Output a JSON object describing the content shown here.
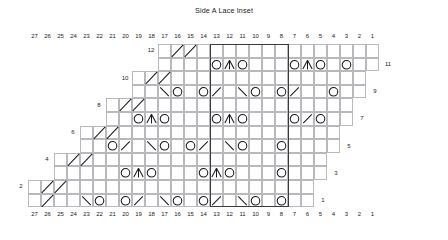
{
  "title": "Side A Lace Inset",
  "colors": {
    "grid_line": "#b9b9bd",
    "heavy_line": "#3a3a3a",
    "symbol": "#1a1a1a",
    "text": "#222222",
    "background": "#ffffff"
  },
  "geometry": {
    "cell_w": 13.0,
    "cell_h": 13.6,
    "grid_left": 28.0,
    "grid_top": 44.0,
    "cols": 27,
    "rows": 12
  },
  "axis": {
    "column_numbers_top": [
      27,
      26,
      25,
      24,
      23,
      22,
      21,
      20,
      19,
      18,
      17,
      16,
      15,
      14,
      13,
      12,
      11,
      10,
      9,
      8,
      7,
      6,
      5,
      4,
      3,
      2,
      1
    ],
    "column_numbers_bottom": [
      27,
      26,
      25,
      24,
      23,
      22,
      21,
      20,
      19,
      18,
      17,
      16,
      15,
      14,
      13,
      12,
      11,
      10,
      9,
      8,
      7,
      6,
      5,
      4,
      3,
      2,
      1
    ],
    "row_numbers_left": [
      12,
      10,
      8,
      6,
      4,
      2
    ],
    "row_numbers_right": [
      11,
      9,
      7,
      5,
      3,
      1
    ]
  },
  "legend_symbols": {
    "yo": "yarn-over",
    "k2tog": "right-leaning-decrease",
    "ssk": "left-leaning-decrease",
    "cdd": "central-double-decrease",
    "edge": "diagonal-edge-line"
  },
  "chart_data": {
    "type": "table",
    "title": "Side A Lace Inset",
    "xlabel": "Stitch",
    "ylabel": "Row",
    "cols": 27,
    "rows": 12,
    "heavy_column_boundaries": [
      8,
      14
    ],
    "note": "Columns numbered right-to-left 27..1. Row extents give first and last worked column number for each row.",
    "row_extents": [
      {
        "row": 1,
        "col_hi": 27,
        "col_lo": 6
      },
      {
        "row": 2,
        "col_hi": 27,
        "col_lo": 6
      },
      {
        "row": 3,
        "col_hi": 25,
        "col_lo": 5
      },
      {
        "row": 4,
        "col_hi": 25,
        "col_lo": 5
      },
      {
        "row": 5,
        "col_hi": 23,
        "col_lo": 4
      },
      {
        "row": 6,
        "col_hi": 23,
        "col_lo": 4
      },
      {
        "row": 7,
        "col_hi": 21,
        "col_lo": 3
      },
      {
        "row": 8,
        "col_hi": 21,
        "col_lo": 3
      },
      {
        "row": 9,
        "col_hi": 19,
        "col_lo": 2
      },
      {
        "row": 10,
        "col_hi": 19,
        "col_lo": 2
      },
      {
        "row": 11,
        "col_hi": 17,
        "col_lo": 1
      },
      {
        "row": 12,
        "col_hi": 17,
        "col_lo": 1
      }
    ],
    "symbols": [
      {
        "row": 1,
        "col": 26,
        "sym": "edge"
      },
      {
        "row": 1,
        "col": 23,
        "sym": "ssk"
      },
      {
        "row": 1,
        "col": 22,
        "sym": "yo"
      },
      {
        "row": 1,
        "col": 20,
        "sym": "yo"
      },
      {
        "row": 1,
        "col": 19,
        "sym": "k2tog"
      },
      {
        "row": 1,
        "col": 17,
        "sym": "ssk"
      },
      {
        "row": 1,
        "col": 16,
        "sym": "yo"
      },
      {
        "row": 1,
        "col": 14,
        "sym": "yo"
      },
      {
        "row": 1,
        "col": 13,
        "sym": "k2tog"
      },
      {
        "row": 1,
        "col": 11,
        "sym": "ssk"
      },
      {
        "row": 1,
        "col": 10,
        "sym": "yo"
      },
      {
        "row": 1,
        "col": 8,
        "sym": "yo"
      },
      {
        "row": 2,
        "col": 25,
        "sym": "edge"
      },
      {
        "row": 2,
        "col": 26,
        "sym": "edge"
      },
      {
        "row": 3,
        "col": 20,
        "sym": "yo"
      },
      {
        "row": 3,
        "col": 19,
        "sym": "cdd"
      },
      {
        "row": 3,
        "col": 18,
        "sym": "yo"
      },
      {
        "row": 3,
        "col": 14,
        "sym": "yo"
      },
      {
        "row": 3,
        "col": 13,
        "sym": "cdd"
      },
      {
        "row": 3,
        "col": 12,
        "sym": "yo"
      },
      {
        "row": 3,
        "col": 8,
        "sym": "yo"
      },
      {
        "row": 4,
        "col": 24,
        "sym": "edge"
      },
      {
        "row": 4,
        "col": 23,
        "sym": "edge"
      },
      {
        "row": 5,
        "col": 21,
        "sym": "yo"
      },
      {
        "row": 5,
        "col": 20,
        "sym": "k2tog"
      },
      {
        "row": 5,
        "col": 18,
        "sym": "ssk"
      },
      {
        "row": 5,
        "col": 17,
        "sym": "yo"
      },
      {
        "row": 5,
        "col": 15,
        "sym": "yo"
      },
      {
        "row": 5,
        "col": 14,
        "sym": "k2tog"
      },
      {
        "row": 5,
        "col": 12,
        "sym": "ssk"
      },
      {
        "row": 5,
        "col": 11,
        "sym": "yo"
      },
      {
        "row": 5,
        "col": 8,
        "sym": "yo"
      },
      {
        "row": 6,
        "col": 22,
        "sym": "edge"
      },
      {
        "row": 6,
        "col": 21,
        "sym": "edge"
      },
      {
        "row": 7,
        "col": 19,
        "sym": "yo"
      },
      {
        "row": 7,
        "col": 18,
        "sym": "cdd"
      },
      {
        "row": 7,
        "col": 17,
        "sym": "yo"
      },
      {
        "row": 7,
        "col": 13,
        "sym": "yo"
      },
      {
        "row": 7,
        "col": 12,
        "sym": "cdd"
      },
      {
        "row": 7,
        "col": 11,
        "sym": "yo"
      },
      {
        "row": 7,
        "col": 7,
        "sym": "yo"
      },
      {
        "row": 7,
        "col": 6,
        "sym": "k2tog"
      },
      {
        "row": 7,
        "col": 5,
        "sym": "yo"
      },
      {
        "row": 8,
        "col": 20,
        "sym": "edge"
      },
      {
        "row": 8,
        "col": 19,
        "sym": "edge"
      },
      {
        "row": 9,
        "col": 17,
        "sym": "ssk"
      },
      {
        "row": 9,
        "col": 16,
        "sym": "yo"
      },
      {
        "row": 9,
        "col": 14,
        "sym": "yo"
      },
      {
        "row": 9,
        "col": 13,
        "sym": "k2tog"
      },
      {
        "row": 9,
        "col": 11,
        "sym": "ssk"
      },
      {
        "row": 9,
        "col": 10,
        "sym": "yo"
      },
      {
        "row": 9,
        "col": 8,
        "sym": "yo"
      },
      {
        "row": 9,
        "col": 7,
        "sym": "k2tog"
      },
      {
        "row": 9,
        "col": 4,
        "sym": "yo"
      },
      {
        "row": 10,
        "col": 18,
        "sym": "edge"
      },
      {
        "row": 10,
        "col": 17,
        "sym": "edge"
      },
      {
        "row": 11,
        "col": 13,
        "sym": "yo"
      },
      {
        "row": 11,
        "col": 12,
        "sym": "cdd"
      },
      {
        "row": 11,
        "col": 11,
        "sym": "yo"
      },
      {
        "row": 11,
        "col": 7,
        "sym": "yo"
      },
      {
        "row": 11,
        "col": 6,
        "sym": "cdd"
      },
      {
        "row": 11,
        "col": 5,
        "sym": "yo"
      },
      {
        "row": 11,
        "col": 3,
        "sym": "yo"
      },
      {
        "row": 12,
        "col": 16,
        "sym": "edge"
      },
      {
        "row": 12,
        "col": 15,
        "sym": "edge"
      }
    ]
  }
}
